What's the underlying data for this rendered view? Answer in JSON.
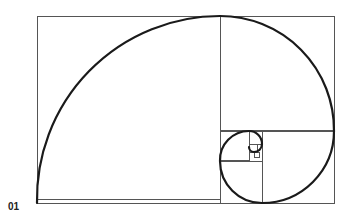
{
  "figure": {
    "label": "01",
    "colors": {
      "grid": "#555555",
      "spiral": "#1a1a1a",
      "background": "#ffffff"
    }
  },
  "rectangle": {
    "x": 37,
    "y": 16,
    "w": 297,
    "h": 187
  },
  "squares": [
    {
      "x": 37,
      "y": 16,
      "s": 183
    },
    {
      "x": 220,
      "y": 16,
      "s": 114
    },
    {
      "x": 262,
      "y": 131,
      "s": 72
    },
    {
      "x": 220,
      "y": 161,
      "s": 42
    },
    {
      "x": 220,
      "y": 131,
      "s": 29
    },
    {
      "x": 249,
      "y": 131,
      "s": 13
    },
    {
      "x": 249,
      "y": 144,
      "s": 8
    },
    {
      "x": 254,
      "y": 152,
      "s": 5
    }
  ],
  "spiral_arcs": [
    {
      "from": [
        37,
        203
      ],
      "to": [
        220,
        16
      ],
      "r": 183
    },
    {
      "from": [
        220,
        16
      ],
      "to": [
        334,
        131
      ],
      "r": 114
    },
    {
      "from": [
        334,
        131
      ],
      "to": [
        262,
        203
      ],
      "r": 72
    },
    {
      "from": [
        262,
        203
      ],
      "to": [
        220,
        161
      ],
      "r": 42
    },
    {
      "from": [
        220,
        161
      ],
      "to": [
        249,
        131
      ],
      "r": 29
    },
    {
      "from": [
        249,
        131
      ],
      "to": [
        262,
        144
      ],
      "r": 13
    },
    {
      "from": [
        262,
        144
      ],
      "to": [
        254,
        152
      ],
      "r": 8
    },
    {
      "from": [
        254,
        152
      ],
      "to": [
        249,
        147
      ],
      "r": 5
    }
  ]
}
